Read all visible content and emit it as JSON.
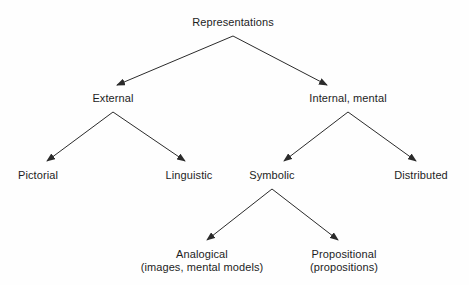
{
  "diagram": {
    "title_node": "Representations",
    "style": {
      "line_color": "#2b2b2b",
      "text_color": "#1d1d1d",
      "background": "#fefefe"
    },
    "nodes": [
      {
        "id": "representations",
        "label": "Representations",
        "sub": "",
        "x": 233,
        "y": 16
      },
      {
        "id": "external",
        "label": "External",
        "sub": "",
        "x": 113,
        "y": 92
      },
      {
        "id": "internal-mental",
        "label": "Internal, mental",
        "sub": "",
        "x": 348,
        "y": 92
      },
      {
        "id": "pictorial",
        "label": "Pictorial",
        "sub": "",
        "x": 38,
        "y": 169
      },
      {
        "id": "linguistic",
        "label": "Linguistic",
        "sub": "",
        "x": 189,
        "y": 169
      },
      {
        "id": "symbolic",
        "label": "Symbolic",
        "sub": "",
        "x": 272,
        "y": 169
      },
      {
        "id": "distributed",
        "label": "Distributed",
        "sub": "",
        "x": 421,
        "y": 169
      },
      {
        "id": "analogical",
        "label": "Analogical",
        "sub": "(images, mental models)",
        "x": 202,
        "y": 248
      },
      {
        "id": "propositional",
        "label": "Propositional",
        "sub": "(propositions)",
        "x": 344,
        "y": 248
      }
    ],
    "edges": [
      {
        "from": "representations",
        "to": "external",
        "x1": 233,
        "y1": 36,
        "x2": 117,
        "y2": 85
      },
      {
        "from": "representations",
        "to": "internal-mental",
        "x1": 233,
        "y1": 36,
        "x2": 327,
        "y2": 85
      },
      {
        "from": "external",
        "to": "pictorial",
        "x1": 113,
        "y1": 112,
        "x2": 47,
        "y2": 161
      },
      {
        "from": "external",
        "to": "linguistic",
        "x1": 113,
        "y1": 112,
        "x2": 185,
        "y2": 161
      },
      {
        "from": "internal-mental",
        "to": "symbolic",
        "x1": 348,
        "y1": 112,
        "x2": 284,
        "y2": 161
      },
      {
        "from": "internal-mental",
        "to": "distributed",
        "x1": 348,
        "y1": 112,
        "x2": 416,
        "y2": 161
      },
      {
        "from": "symbolic",
        "to": "analogical",
        "x1": 272,
        "y1": 189,
        "x2": 207,
        "y2": 240
      },
      {
        "from": "symbolic",
        "to": "propositional",
        "x1": 272,
        "y1": 189,
        "x2": 338,
        "y2": 240
      }
    ]
  }
}
